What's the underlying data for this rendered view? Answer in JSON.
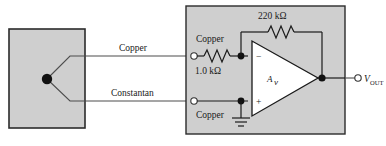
{
  "figure": {
    "background_color": "#ffffff",
    "panel_fill": "#cfcfcf",
    "panel_stroke": "#2b2b2b",
    "wire_color": "#4d4d4d",
    "node_color": "#111111"
  },
  "sensor": {
    "block_name": "thermocouple-block",
    "junction_name": "thermocouple-junction"
  },
  "leads": {
    "upper_label": "Copper",
    "lower_label": "Constantan"
  },
  "amplifier_panel": {
    "input_resistor": {
      "label_top": "Copper",
      "label_value": "1.0 kΩ"
    },
    "feedback_resistor": {
      "label_value": "220 kΩ"
    },
    "lower_input": {
      "label": "Copper"
    },
    "opamp": {
      "gain_symbol": "A",
      "gain_subscript": "v",
      "inverting_sign": "−",
      "noninverting_sign": "+"
    },
    "ground": {
      "name": "ground-symbol"
    },
    "output": {
      "label": "V",
      "label_subscript": "OUT"
    }
  }
}
